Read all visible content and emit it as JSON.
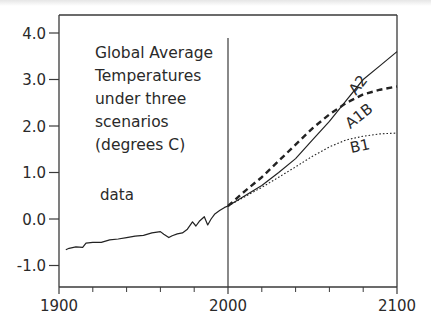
{
  "chart_data": {
    "type": "line",
    "title_lines": [
      "Global Average",
      "Temperatures",
      "under three",
      "scenarios",
      "(degrees C)"
    ],
    "xlabel": "",
    "ylabel": "",
    "xlim": [
      1900,
      2100
    ],
    "ylim": [
      -1.5,
      4.5
    ],
    "x_ticks": [
      1900,
      2000,
      2100
    ],
    "x_tick_labels": [
      "1900",
      "2000",
      "2100"
    ],
    "x_minor_ticks": [
      1920,
      1940,
      1960,
      1980,
      2020,
      2040,
      2060,
      2080
    ],
    "y_ticks": [
      4.0,
      3.0,
      2.0,
      1.0,
      0.0,
      -1.0
    ],
    "y_tick_labels": [
      "4.0",
      "3.0",
      "2.0",
      "1.0",
      "0.0",
      "-1.0"
    ],
    "divider_year": 2000,
    "grid": false,
    "legend": "inline labels",
    "series": [
      {
        "name": "data",
        "label": "data",
        "style": "solid",
        "x": [
          1904,
          1906,
          1910,
          1914,
          1916,
          1920,
          1925,
          1930,
          1935,
          1940,
          1945,
          1950,
          1955,
          1960,
          1962,
          1965,
          1967,
          1970,
          1973,
          1976,
          1979,
          1981,
          1983,
          1986,
          1988,
          1990,
          1992,
          1995,
          1998,
          2000
        ],
        "values": [
          -0.66,
          -0.63,
          -0.6,
          -0.61,
          -0.52,
          -0.5,
          -0.5,
          -0.45,
          -0.43,
          -0.4,
          -0.37,
          -0.35,
          -0.3,
          -0.27,
          -0.33,
          -0.4,
          -0.36,
          -0.32,
          -0.3,
          -0.22,
          -0.06,
          -0.15,
          -0.05,
          0.05,
          -0.13,
          0.0,
          0.1,
          0.18,
          0.25,
          0.28
        ]
      },
      {
        "name": "A2",
        "label": "A2",
        "style": "solid",
        "x": [
          2000,
          2010,
          2020,
          2030,
          2040,
          2050,
          2060,
          2070,
          2080,
          2090,
          2100
        ],
        "values": [
          0.28,
          0.5,
          0.72,
          1.0,
          1.3,
          1.7,
          2.1,
          2.55,
          3.0,
          3.3,
          3.6
        ]
      },
      {
        "name": "A1B",
        "label": "A1B",
        "style": "dashed",
        "x": [
          2000,
          2010,
          2020,
          2030,
          2040,
          2050,
          2060,
          2070,
          2080,
          2090,
          2100
        ],
        "values": [
          0.28,
          0.6,
          0.9,
          1.25,
          1.6,
          1.95,
          2.25,
          2.5,
          2.68,
          2.78,
          2.85
        ]
      },
      {
        "name": "B1",
        "label": "B1",
        "style": "dotted",
        "x": [
          2000,
          2010,
          2020,
          2030,
          2040,
          2050,
          2060,
          2070,
          2080,
          2090,
          2100
        ],
        "values": [
          0.28,
          0.48,
          0.68,
          0.9,
          1.12,
          1.35,
          1.55,
          1.7,
          1.78,
          1.83,
          1.85
        ]
      }
    ],
    "colors": {
      "axis": "#3a3a3a",
      "line": "#222222",
      "text": "#2a2a2a"
    }
  }
}
